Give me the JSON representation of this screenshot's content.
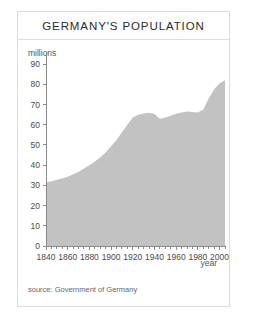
{
  "card": {
    "title": "GERMANY'S POPULATION",
    "source_note": "source: Government of Germany"
  },
  "axes": {
    "y_axis_label": "millions",
    "x_axis_label": "year",
    "y_ticks": [
      "0",
      "10",
      "20",
      "30",
      "40",
      "50",
      "60",
      "70",
      "80",
      "90"
    ],
    "x_ticks": [
      "1840",
      "1860",
      "1880",
      "1900",
      "1920",
      "1940",
      "1960",
      "1980",
      "2000"
    ]
  },
  "colors": {
    "area_fill": "#c2c2c2",
    "axis": "#8a8a8a",
    "card_border": "#dcdcdc",
    "title_text": "#2b2b2b",
    "label_text": "#555555",
    "source_text": "#666666",
    "background": "#ffffff"
  },
  "chart_data": {
    "type": "area",
    "title": "GERMANY'S POPULATION",
    "xlabel": "year",
    "ylabel": "millions",
    "xlim": [
      1840,
      2005
    ],
    "ylim": [
      0,
      95
    ],
    "grid": false,
    "legend": null,
    "y_tick_values": [
      0,
      10,
      20,
      30,
      40,
      50,
      60,
      70,
      80,
      90
    ],
    "x_tick_values": [
      1840,
      1860,
      1880,
      1900,
      1920,
      1940,
      1960,
      1980,
      2000
    ],
    "x_minor_tick_step": 5,
    "series": [
      {
        "name": "Population (millions)",
        "x": [
          1840,
          1845,
          1850,
          1855,
          1860,
          1865,
          1870,
          1875,
          1880,
          1885,
          1890,
          1895,
          1900,
          1905,
          1910,
          1915,
          1920,
          1925,
          1930,
          1935,
          1940,
          1945,
          1950,
          1955,
          1960,
          1965,
          1970,
          1975,
          1980,
          1985,
          1990,
          1995,
          2000,
          2005
        ],
        "values": [
          31.4,
          32.0,
          32.8,
          33.4,
          34.3,
          35.5,
          36.8,
          38.3,
          40.0,
          41.8,
          43.8,
          46.3,
          49.3,
          52.5,
          56.3,
          60.0,
          63.6,
          65.0,
          65.6,
          65.9,
          65.3,
          63.0,
          63.6,
          64.5,
          65.4,
          66.0,
          66.5,
          66.3,
          66.0,
          67.5,
          73.0,
          77.5,
          80.5,
          82.0
        ]
      }
    ],
    "annotations": [
      {
        "text": "source: Government of Germany",
        "position": "bottom-left"
      }
    ]
  }
}
